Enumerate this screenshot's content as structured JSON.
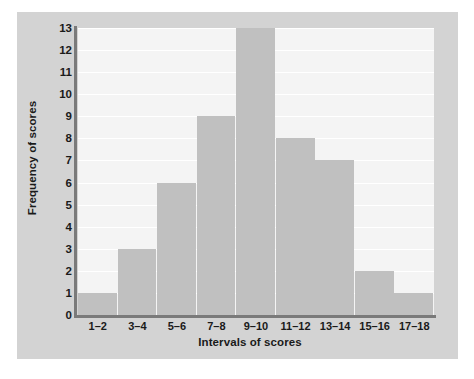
{
  "chart_data": {
    "type": "bar",
    "title": "",
    "xlabel": "Intervals of scores",
    "ylabel": "Frequency of scores",
    "categories": [
      "1–2",
      "3–4",
      "5–6",
      "7–8",
      "9–10",
      "11–12",
      "13–14",
      "15–16",
      "17–18"
    ],
    "values": [
      1,
      3,
      6,
      9,
      13,
      8,
      7,
      2,
      1
    ],
    "ylim": [
      0,
      13
    ],
    "yticks": [
      0,
      1,
      2,
      3,
      4,
      5,
      6,
      7,
      8,
      9,
      10,
      11,
      12,
      13
    ],
    "ytick_labels": [
      "0",
      "1",
      "2",
      "3",
      "4",
      "5",
      "6",
      "7",
      "8",
      "9",
      "10",
      "11",
      "12",
      "13"
    ],
    "grid": true,
    "grid_orientation": "horizontal",
    "legend": null,
    "bar_color": "#c0c0c0",
    "plot_background": "#f4f4f4",
    "panel_background": "#d3d3d3",
    "gridline_color": "#ffffff",
    "axis_color": "#7a7a7a",
    "text_color": "#1a1a1a"
  }
}
